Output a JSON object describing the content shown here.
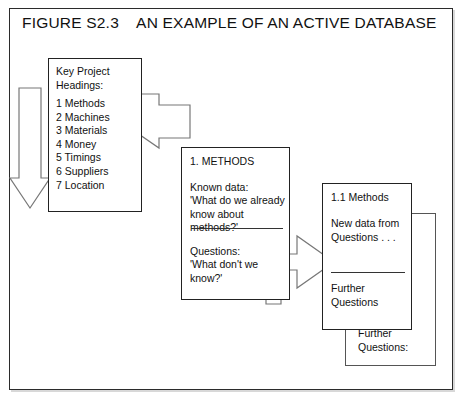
{
  "figure": {
    "title": "FIGURE S2.3    AN EXAMPLE OF AN ACTIVE DATABASE"
  },
  "boxes": {
    "key_project": {
      "heading": "Key Project\nHeadings:",
      "items": [
        "1 Methods",
        "2 Machines",
        "3 Materials",
        "4 Money",
        "5 Timings",
        "6 Suppliers",
        "7 Location"
      ]
    },
    "methods": {
      "title": "1. METHODS",
      "known_label": "Known data:",
      "known_text": "'What do we already\nknow about\nmethods?'",
      "questions_label": "Questions:",
      "questions_text": "'What don't we\nknow?'"
    },
    "methods_sub": {
      "title": "1.1 Methods",
      "new_data": "New data from\nQuestions . . .",
      "further": "Further\nQuestions"
    },
    "back_card": {
      "further": "Further\nQuestions:"
    }
  },
  "arrows": {
    "down_arrow": "down-arrow",
    "arrow_key_to_methods": "arrow-key-project-to-methods",
    "arrow_methods_to_sub": "arrow-methods-to-sub-methods"
  },
  "colors": {
    "frame": "#2b2b2b",
    "box_border": "#222222",
    "arrow_stroke": "#777777",
    "text": "#111111",
    "background": "#ffffff"
  }
}
